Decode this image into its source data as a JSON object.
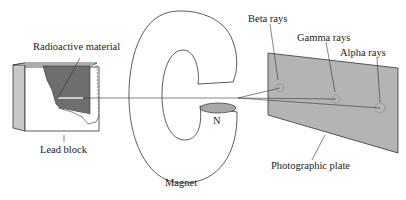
{
  "diagram": {
    "labels": {
      "radioactive_material": "Radioactive material",
      "lead_block": "Lead block",
      "magnet": "Magnet",
      "north_pole": "N",
      "beta_rays": "Beta rays",
      "gamma_rays": "Gamma rays",
      "alpha_rays": "Alpha rays",
      "photographic_plate": "Photographic plate"
    },
    "colors": {
      "radioactive_fill": "#6e6e6e",
      "plate_fill": "#b4b4b4",
      "pole_fill": "#a8a8a8",
      "block_side": "#c8c8c8",
      "line": "#333333"
    }
  }
}
